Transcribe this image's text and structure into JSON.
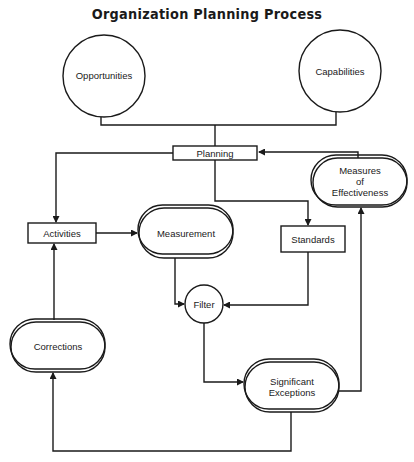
{
  "title": "Organization Planning Process",
  "nodes": {
    "opportunities": {
      "label": "Opportunities",
      "shape": "circle"
    },
    "capabilities": {
      "label": "Capabilities",
      "shape": "circle"
    },
    "planning": {
      "label": "Planning",
      "shape": "rectangle"
    },
    "activities": {
      "label": "Activities",
      "shape": "rectangle"
    },
    "measurement": {
      "label": "Measurement",
      "shape": "double-stadium"
    },
    "standards": {
      "label": "Standards",
      "shape": "rectangle"
    },
    "measures_of_effectiveness": {
      "label_lines": [
        "Measures",
        "of",
        "Effectiveness"
      ],
      "shape": "double-stadium"
    },
    "filter": {
      "label": "Filter",
      "shape": "circle"
    },
    "corrections": {
      "label": "Corrections",
      "shape": "double-stadium"
    },
    "significant_exceptions": {
      "label_lines": [
        "Significant",
        "Exceptions"
      ],
      "shape": "double-stadium"
    }
  },
  "edges": [
    {
      "from": "Opportunities",
      "to": "Planning"
    },
    {
      "from": "Capabilities",
      "to": "Planning"
    },
    {
      "from": "Planning",
      "to": "Activities"
    },
    {
      "from": "Planning",
      "to": "Standards"
    },
    {
      "from": "Measures of Effectiveness",
      "to": "Planning"
    },
    {
      "from": "Activities",
      "to": "Measurement"
    },
    {
      "from": "Measurement",
      "to": "Filter"
    },
    {
      "from": "Standards",
      "to": "Filter"
    },
    {
      "from": "Filter",
      "to": "Significant Exceptions"
    },
    {
      "from": "Significant Exceptions",
      "to": "Measures of Effectiveness"
    },
    {
      "from": "Significant Exceptions",
      "to": "Corrections"
    },
    {
      "from": "Corrections",
      "to": "Activities"
    }
  ],
  "colors": {
    "stroke": "#1a1a1a",
    "background": "#ffffff"
  }
}
